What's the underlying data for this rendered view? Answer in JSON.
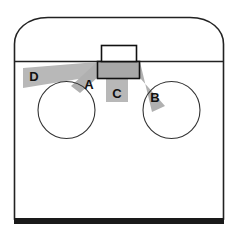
{
  "diagram": {
    "background_color": "#ffffff",
    "outline_color": "#222222",
    "band_color": "#b0b0b0",
    "band_color_light": "#c8c8c8",
    "box_fill_color": "#a8a8a8",
    "floor_bar_color": "#1a1a1a",
    "labels": {
      "a": "A",
      "b": "B",
      "c": "C",
      "d": "D"
    },
    "shapes": {
      "left_circle": "wheel-left",
      "right_circle": "wheel-right",
      "upper_box": "upper-box",
      "lower_box": "lower-box",
      "deck_line": "deck-line",
      "floor_bar": "floor-bar",
      "body_outline": "body-outline"
    }
  }
}
